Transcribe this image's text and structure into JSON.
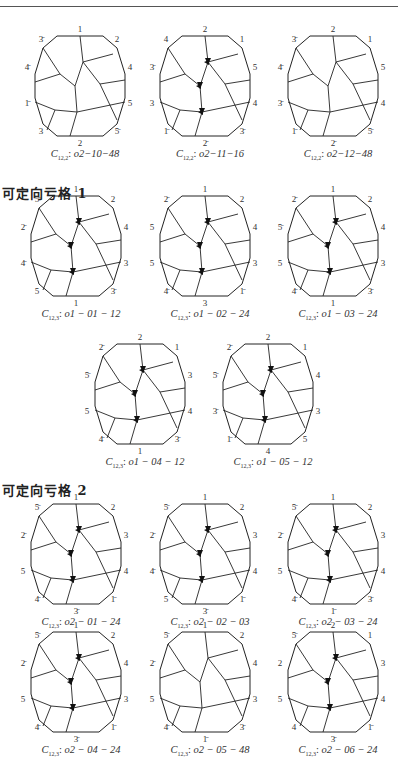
{
  "page": {
    "sections": [
      {
        "title": "",
        "figures": [
          {
            "id": "f1",
            "caption_sym": "C",
            "caption_sub": "12,2",
            "caption_code": "o2−10−48",
            "labels": [
              "1",
              "2",
              "4",
              "5",
              "5̄",
              "2",
              "3",
              "1̄",
              "4̄",
              "3̄"
            ]
          },
          {
            "id": "f2",
            "caption_sym": "C",
            "caption_sub": "12,2",
            "caption_code": "o2−11−16",
            "labels": [
              "2",
              "1",
              "5",
              "4",
              "3̄",
              "2̄",
              "1̄",
              "3",
              "3̄",
              "4"
            ]
          },
          {
            "id": "f3",
            "caption_sym": "C",
            "caption_sub": "12,2",
            "caption_code": "o2−12−48",
            "labels": [
              "2",
              "1",
              "5",
              "4",
              "5̄",
              "2̄",
              "1̄",
              "3̄",
              "4̄",
              "3̄"
            ]
          }
        ]
      },
      {
        "title": "可定向亏格 1",
        "figures": [
          {
            "id": "f4",
            "caption_sym": "C",
            "caption_sub": "12,3",
            "caption_code": "o1 − 01 − 12",
            "labels": [
              "1",
              "2",
              "4",
              "3",
              "3̄",
              "1",
              "5",
              "4̄",
              "2̄",
              "5̄"
            ]
          },
          {
            "id": "f5",
            "caption_sym": "C",
            "caption_sub": "12,3",
            "caption_code": "o1 − 02 − 24",
            "labels": [
              "1",
              "2",
              "4",
              "3",
              "1̄",
              "3",
              "4̄",
              "5",
              "5",
              "2̄"
            ]
          },
          {
            "id": "f6",
            "caption_sym": "C",
            "caption_sub": "12,3",
            "caption_code": "o1 − 03 − 24",
            "labels": [
              "1",
              "2",
              "4",
              "3",
              "3̄",
              "1",
              "4̄",
              "5",
              "5̄",
              "2̄"
            ]
          },
          {
            "id": "f7",
            "caption_sym": "C",
            "caption_sub": "12,3",
            "caption_code": "o1 − 04 − 12",
            "labels": [
              "2",
              "1",
              "3",
              "4",
              "3̄",
              "1",
              "4̄",
              "5",
              "5̄",
              "2̄"
            ]
          },
          {
            "id": "f8",
            "caption_sym": "C",
            "caption_sub": "12,3",
            "caption_code": "o1 − 05 − 12",
            "labels": [
              "2",
              "1",
              "4",
              "3",
              "5",
              "4",
              "1̄",
              "3̄",
              "5̄",
              "2̄"
            ]
          }
        ]
      },
      {
        "title": "可定向亏格 2",
        "figures": [
          {
            "id": "f9",
            "caption_sym": "C",
            "caption_sub": "12,3",
            "caption_code": "o2 − 01 − 24",
            "labels": [
              "1",
              "2",
              "3",
              "4",
              "1̄",
              "3̄",
              "4̄",
              "5",
              "2̄",
              "5̄"
            ]
          },
          {
            "id": "f10",
            "caption_sym": "C",
            "caption_sub": "12,3",
            "caption_code": "o2 − 02 − 03",
            "labels": [
              "1",
              "2",
              "3",
              "4",
              "1̄",
              "3̄",
              "5",
              "4̄",
              "2̄",
              "5̄"
            ]
          },
          {
            "id": "f11",
            "caption_sym": "C",
            "caption_sub": "12,3",
            "caption_code": "o2 − 03 − 24",
            "labels": [
              "1",
              "2",
              "3",
              "4",
              "3̄",
              "1̄",
              "4̄",
              "5",
              "2̄",
              "5̄"
            ]
          },
          {
            "id": "f12",
            "caption_sym": "C",
            "caption_sub": "12,3",
            "caption_code": "o2 − 04 − 24",
            "labels": [
              "1",
              "2",
              "4",
              "3",
              "1̄",
              "3̄",
              "4̄",
              "5",
              "2̄",
              "5̄"
            ]
          },
          {
            "id": "f13",
            "caption_sym": "C",
            "caption_sub": "12,3",
            "caption_code": "o2 − 05 − 48",
            "labels": [
              "1",
              "2",
              "4",
              "3",
              "3̄",
              "1̄",
              "4̄",
              "5",
              "2̄",
              "5̄"
            ]
          },
          {
            "id": "f14",
            "caption_sym": "C",
            "caption_sub": "12,3",
            "caption_code": "o2 − 06 − 24",
            "labels": [
              "2",
              "1",
              "3",
              "4",
              "1̄",
              "3̄",
              "4",
              "5",
              "2",
              "5̄"
            ]
          }
        ]
      }
    ]
  }
}
